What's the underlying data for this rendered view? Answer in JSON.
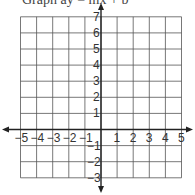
{
  "header": {
    "clipped_text": "Graph ay = mx + b"
  },
  "grid": {
    "x_min": -5,
    "x_max": 5,
    "y_min": -3,
    "y_max": 7,
    "cell_px": 16.1,
    "origin_px": [
      101,
      129.5
    ],
    "line_color": "#555555",
    "axis_color": "#222222"
  },
  "x_labels": [
    "−5",
    "−4",
    "−3",
    "−2",
    "−1",
    "1",
    "2",
    "3",
    "4",
    "5"
  ],
  "x_values": [
    -5,
    -4,
    -3,
    -2,
    -1,
    1,
    2,
    3,
    4,
    5
  ],
  "y_labels": [
    "7",
    "6",
    "5",
    "4",
    "3",
    "2",
    "1",
    "−1",
    "−2",
    "−3"
  ],
  "y_values": [
    7,
    6,
    5,
    4,
    3,
    2,
    1,
    -1,
    -2,
    -3
  ]
}
